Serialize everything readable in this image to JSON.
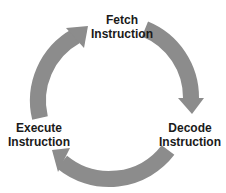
{
  "diagram": {
    "type": "cycle",
    "arrow_color": "#8c8c8c",
    "steps": [
      {
        "line1": "Fetch",
        "line2": "Instruction"
      },
      {
        "line1": "Decode",
        "line2": "Instruction"
      },
      {
        "line1": "Execute",
        "line2": "Instruction"
      }
    ]
  }
}
